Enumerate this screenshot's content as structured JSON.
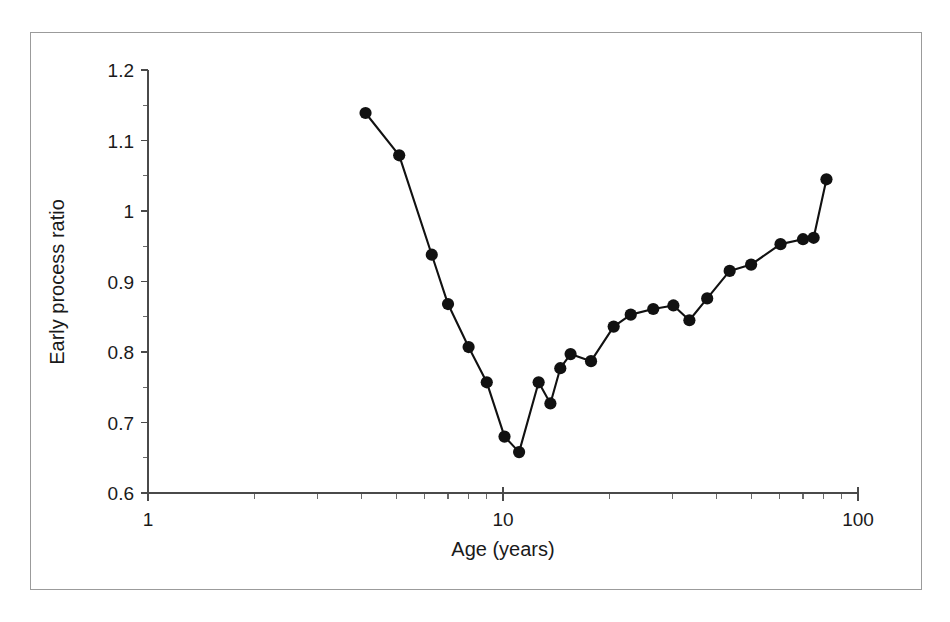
{
  "figure": {
    "frame_color": "#9b9b9b",
    "background": "#ffffff",
    "line_color": "#111111",
    "axis_color": "#4a4a4a"
  },
  "chart_data": {
    "type": "line",
    "title": "",
    "subtitle": "",
    "xlabel": "Age (years)",
    "ylabel": "Early process ratio",
    "xscale": "log",
    "yscale": "linear",
    "xlim": [
      1,
      100
    ],
    "ylim": [
      0.6,
      1.2
    ],
    "grid": false,
    "legend": null,
    "legend_position": "none",
    "marker": "filled-circle",
    "x_tick_labels": [
      "1",
      "10",
      "100"
    ],
    "x_tick_values": [
      1,
      10,
      100
    ],
    "x_minor_ticks": [
      2,
      3,
      4,
      5,
      6,
      7,
      8,
      9,
      20,
      30,
      40,
      50,
      60,
      70,
      80,
      90
    ],
    "y_tick_labels": [
      "0.6",
      "0.7",
      "0.8",
      "0.9",
      "1",
      "1.1",
      "1.2"
    ],
    "y_tick_values": [
      0.6,
      0.7,
      0.8,
      0.9,
      1.0,
      1.1,
      1.2
    ],
    "y_minor_ticks": [
      0.65,
      0.75,
      0.85,
      0.95,
      1.05,
      1.15
    ],
    "series": [
      {
        "name": "Early process ratio",
        "x": [
          4.1,
          5.1,
          6.3,
          7.0,
          8.0,
          9.0,
          10.1,
          11.1,
          12.6,
          13.6,
          14.5,
          15.5,
          17.7,
          20.5,
          22.9,
          26.5,
          30.2,
          33.5,
          37.6,
          43.5,
          50.0,
          60.5,
          70.0,
          75.0,
          81.5
        ],
        "y": [
          1.139,
          1.079,
          0.938,
          0.868,
          0.807,
          0.757,
          0.68,
          0.658,
          0.757,
          0.727,
          0.777,
          0.797,
          0.787,
          0.836,
          0.853,
          0.861,
          0.866,
          0.845,
          0.876,
          0.915,
          0.924,
          0.953,
          0.96,
          0.962,
          1.045
        ]
      }
    ]
  }
}
